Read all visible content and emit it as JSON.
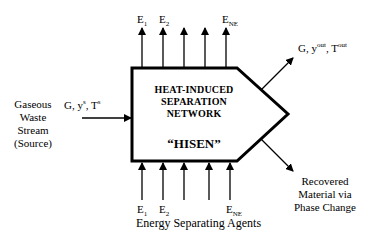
{
  "diagram": {
    "box": {
      "title_lines": [
        "HEAT-INDUCED",
        "SEPARATION",
        "NETWORK"
      ],
      "name": "“HISEN”"
    },
    "source": {
      "label_lines": [
        "Gaseous",
        "Waste",
        "Stream",
        "(Source)"
      ],
      "stream_main": "G, y",
      "stream_sup1": "s",
      "stream_mid": ", T",
      "stream_sup2": "s"
    },
    "outlet_gas": {
      "main": "G, y",
      "sup1": "out",
      "mid": ", T",
      "sup2": "out"
    },
    "outlet_material": {
      "label_lines": [
        "Recovered",
        "Material via",
        "Phase Change"
      ]
    },
    "top_agents": {
      "labels": [
        {
          "base": "E",
          "sub": "1"
        },
        {
          "base": "E",
          "sub": "2"
        },
        {
          "base": "E",
          "sub": "NE"
        }
      ]
    },
    "bottom_agents": {
      "labels": [
        {
          "base": "E",
          "sub": "1"
        },
        {
          "base": "E",
          "sub": "2"
        },
        {
          "base": "E",
          "sub": "NE"
        }
      ],
      "caption": "Energy Separating Agents"
    }
  }
}
